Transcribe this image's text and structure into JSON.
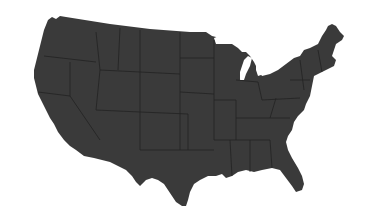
{
  "map": {
    "subject": "United States (contiguous) with state borders",
    "fill_color": "#3a3a3a",
    "border_color": "#1e1e1e",
    "background_color": "#ffffff",
    "lake_color": "#ffffff"
  }
}
